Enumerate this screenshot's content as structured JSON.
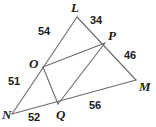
{
  "figure": {
    "type": "geometry-diagram",
    "stroke_color": "#6b6b6b",
    "text_color": "#1b1b1b",
    "background_color": "#ffffff",
    "width": 156,
    "height": 127,
    "vertices": [
      {
        "name": "L",
        "label": "L",
        "x": 77,
        "y": 17,
        "label_x": 71,
        "label_y": 1
      },
      {
        "name": "P",
        "label": "P",
        "x": 105,
        "y": 43,
        "label_x": 108,
        "label_y": 29
      },
      {
        "name": "M",
        "label": "M",
        "x": 136,
        "y": 80,
        "label_x": 139,
        "label_y": 80
      },
      {
        "name": "N",
        "label": "N",
        "x": 12,
        "y": 114,
        "label_x": 2,
        "label_y": 108
      },
      {
        "name": "Q",
        "label": "Q",
        "x": 58,
        "y": 104,
        "label_x": 56,
        "label_y": 108
      },
      {
        "name": "O",
        "label": "O",
        "x": 43,
        "y": 67,
        "label_x": 29,
        "label_y": 57
      }
    ],
    "segments": [
      {
        "name": "segment-L-N",
        "from": "L",
        "to": "N"
      },
      {
        "name": "segment-L-M",
        "from": "L",
        "to": "M"
      },
      {
        "name": "segment-N-M",
        "from": "N",
        "to": "M"
      },
      {
        "name": "segment-O-P",
        "from": "O",
        "to": "P"
      },
      {
        "name": "segment-O-Q",
        "from": "O",
        "to": "Q"
      },
      {
        "name": "segment-Q-P",
        "from": "Q",
        "to": "P"
      }
    ],
    "measures": [
      {
        "name": "measure-LO",
        "value": "54",
        "edge": "L-O",
        "x": 38,
        "y": 26
      },
      {
        "name": "measure-LP",
        "value": "34",
        "edge": "L-P",
        "x": 90,
        "y": 15
      },
      {
        "name": "measure-PM",
        "value": "46",
        "edge": "P-M",
        "x": 124,
        "y": 50
      },
      {
        "name": "measure-ON",
        "value": "51",
        "edge": "O-N",
        "x": 8,
        "y": 76
      },
      {
        "name": "measure-NQ",
        "value": "52",
        "edge": "N-Q",
        "x": 28,
        "y": 112
      },
      {
        "name": "measure-QM",
        "value": "56",
        "edge": "Q-M",
        "x": 89,
        "y": 100
      }
    ]
  }
}
